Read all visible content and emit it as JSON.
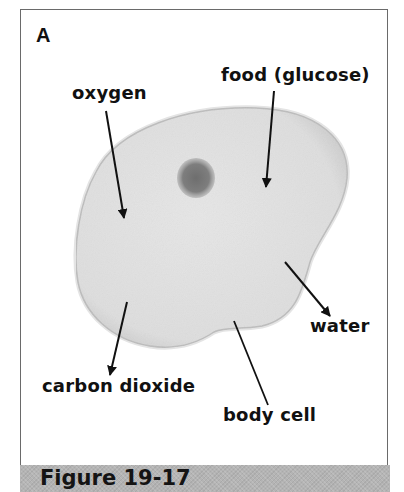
{
  "figure": {
    "panel_letter": "A",
    "caption": "Figure 19-17"
  },
  "labels": {
    "oxygen": "oxygen",
    "food": "food (glucose)",
    "water": "water",
    "carbon_dioxide": "carbon dioxide",
    "body_cell": "body cell"
  },
  "arrows": [
    {
      "name": "oxygen-arrow",
      "direction": "into cell",
      "from": [
        106,
        111
      ],
      "to": [
        124,
        218
      ]
    },
    {
      "name": "food-arrow",
      "direction": "into cell",
      "from": [
        274,
        91
      ],
      "to": [
        266,
        187
      ]
    },
    {
      "name": "water-arrow",
      "direction": "out of cell",
      "from": [
        285,
        262
      ],
      "to": [
        330,
        316
      ]
    },
    {
      "name": "carbon-dioxide-arrow",
      "direction": "out of cell",
      "from": [
        127,
        302
      ],
      "to": [
        110,
        375
      ]
    },
    {
      "name": "body-cell-pointer",
      "direction": "leader line",
      "from": [
        234,
        321
      ],
      "to": [
        268,
        405
      ]
    }
  ],
  "colors": {
    "cell_fill": "#e2e2e2",
    "cell_edge": "#b8b8b8",
    "nucleus": "#7a7a7a",
    "caption_bar": "#b4b4b4",
    "frame": "#6a6a6a"
  }
}
